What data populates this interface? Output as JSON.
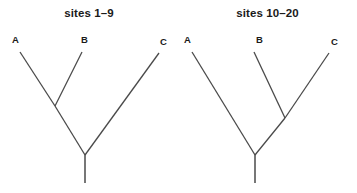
{
  "figure": {
    "background_color": "#ffffff",
    "line_color": "#4a4a4a",
    "text_color": "#1a1a1a",
    "width": 357,
    "height": 193
  },
  "panels": [
    {
      "id": "left",
      "title": "sites 1–9",
      "topology": "((A,B),C)",
      "tips": [
        {
          "name": "A",
          "label": "A",
          "label_x": 12,
          "label_y": 35,
          "tip_x": 20,
          "tip_y": 52
        },
        {
          "name": "B",
          "label": "B",
          "label_x": 81,
          "label_y": 35,
          "tip_x": 82,
          "tip_y": 52
        },
        {
          "name": "C",
          "label": "C",
          "label_x": 160,
          "label_y": 37,
          "tip_x": 159,
          "tip_y": 53
        }
      ],
      "nodes": [
        {
          "name": "ab-node",
          "x": 55,
          "y": 106
        },
        {
          "name": "root-node",
          "x": 85,
          "y": 155
        }
      ],
      "stem": {
        "x": 85,
        "y_top": 155,
        "y_bottom": 183
      }
    },
    {
      "id": "right",
      "title": "sites 10–20",
      "topology": "(A,(B,C))",
      "tips": [
        {
          "name": "A",
          "label": "A",
          "label_x": 6,
          "label_y": 35,
          "tip_x": 14,
          "tip_y": 52
        },
        {
          "name": "B",
          "label": "B",
          "label_x": 78,
          "label_y": 35,
          "tip_x": 76,
          "tip_y": 52
        },
        {
          "name": "C",
          "label": "C",
          "label_x": 153,
          "label_y": 37,
          "tip_x": 151,
          "tip_y": 53
        }
      ],
      "nodes": [
        {
          "name": "bc-node",
          "x": 107,
          "y": 118
        },
        {
          "name": "root-node",
          "x": 77,
          "y": 155
        }
      ],
      "stem": {
        "x": 77,
        "y_top": 155,
        "y_bottom": 183
      }
    }
  ],
  "chart_data": {
    "type": "diagram",
    "subtype": "phylogenetic-tree-pair",
    "title": "",
    "panels": [
      {
        "title": "sites 1–9",
        "taxa": [
          "A",
          "B",
          "C"
        ],
        "newick": "((A,B),C);",
        "description": "A and B group together; C is the outgroup"
      },
      {
        "title": "sites 10–20",
        "taxa": [
          "A",
          "B",
          "C"
        ],
        "newick": "(A,(B,C));",
        "description": "B and C group together; A is the outgroup"
      }
    ]
  }
}
